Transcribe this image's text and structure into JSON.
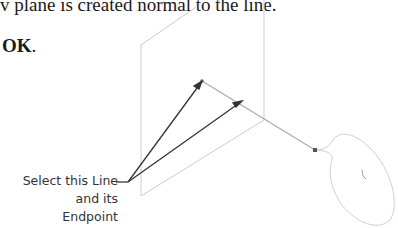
{
  "text": {
    "line1": "v plane is created normal to the line.",
    "line2_bold": "OK",
    "line2_tail": "."
  },
  "callout": {
    "line1": "Select this Line",
    "line2": "and its Endpoint"
  },
  "colors": {
    "plane_edge": "#c8c8c8",
    "arrow": "#333333",
    "sketch": "#b0b0b0"
  }
}
